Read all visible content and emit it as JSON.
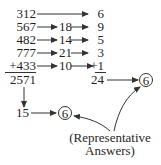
{
  "numbers": [
    "312",
    "567",
    "482",
    "777",
    "+433"
  ],
  "sum": "2571",
  "middle": [
    "",
    "18",
    "14",
    "21",
    "10"
  ],
  "digit_sums": [
    "6",
    "9",
    "5",
    "3",
    "+1"
  ],
  "digit_total": "24",
  "digit_result": "6",
  "sum_reduced": "15",
  "sum_result": "6",
  "label_line1": "(Representative",
  "label_line2": "Answers)"
}
